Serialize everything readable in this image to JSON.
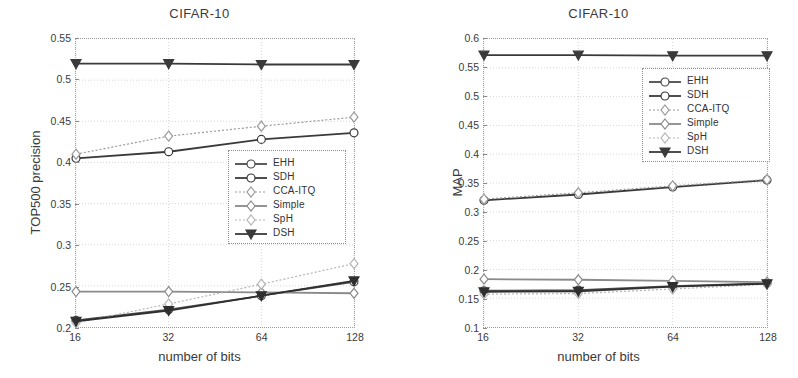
{
  "figure": {
    "x_axis_label": "number of bits",
    "series_names": [
      "EHH",
      "SDH",
      "CCA-ITQ",
      "Simple",
      "SpH",
      "DSH"
    ]
  },
  "chart_data": [
    {
      "type": "line",
      "panel": "left",
      "title": "CIFAR-10",
      "xlabel": "number of bits",
      "ylabel": "TOP500 precision",
      "categories": [
        "16",
        "32",
        "64",
        "128"
      ],
      "x": [
        16,
        32,
        64,
        128
      ],
      "xscale": "log2",
      "xlim": [
        16,
        128
      ],
      "ylim": [
        0.2,
        0.55
      ],
      "yticks": [
        "0.2",
        "0.25",
        "0.3",
        "0.35",
        "0.4",
        "0.45",
        "0.5",
        "0.55"
      ],
      "ytick_values": [
        0.2,
        0.25,
        0.3,
        0.35,
        0.4,
        0.45,
        0.5,
        0.55
      ],
      "grid": true,
      "legend_position": "center-right",
      "series": [
        {
          "name": "EHH",
          "values": [
            0.208,
            0.221,
            0.238,
            0.255
          ],
          "color": "#4a4a4a",
          "marker": "circle",
          "line": "solid"
        },
        {
          "name": "SDH",
          "values": [
            0.405,
            0.413,
            0.428,
            0.436
          ],
          "color": "#3a3a3a",
          "marker": "circle",
          "line": "solid"
        },
        {
          "name": "CCA-ITQ",
          "values": [
            0.41,
            0.432,
            0.444,
            0.455
          ],
          "color": "#9a9a9a",
          "marker": "diamond",
          "line": "dotted"
        },
        {
          "name": "Simple",
          "values": [
            0.243,
            0.243,
            0.242,
            0.241
          ],
          "color": "#8a8a8a",
          "marker": "diamond",
          "line": "solid"
        },
        {
          "name": "SpH",
          "values": [
            0.205,
            0.228,
            0.252,
            0.277
          ],
          "color": "#b4b4b4",
          "marker": "diamond",
          "line": "dotted"
        },
        {
          "name": "DSH",
          "values": [
            0.52,
            0.52,
            0.519,
            0.519
          ],
          "color": "#3a3a3a",
          "marker": "triangle-down",
          "line": "solid"
        },
        {
          "name": "DSH-lower",
          "values": [
            0.207,
            0.22,
            0.238,
            0.256
          ],
          "color": "#2f2f2f",
          "marker": "triangle-down",
          "line": "solid"
        }
      ]
    },
    {
      "type": "line",
      "panel": "right",
      "title": "CIFAR-10",
      "xlabel": "number of bits",
      "ylabel": "MAP",
      "categories": [
        "16",
        "32",
        "64",
        "128"
      ],
      "x": [
        16,
        32,
        64,
        128
      ],
      "xscale": "log2",
      "xlim": [
        16,
        128
      ],
      "ylim": [
        0.1,
        0.6
      ],
      "yticks": [
        "0.1",
        "0.15",
        "0.2",
        "0.25",
        "0.3",
        "0.35",
        "0.4",
        "0.45",
        "0.5",
        "0.55",
        "0.6"
      ],
      "ytick_values": [
        0.1,
        0.15,
        0.2,
        0.25,
        0.3,
        0.35,
        0.4,
        0.45,
        0.5,
        0.55,
        0.6
      ],
      "grid": true,
      "legend_position": "upper-right",
      "series": [
        {
          "name": "EHH",
          "values": [
            0.163,
            0.164,
            0.171,
            0.176
          ],
          "color": "#4a4a4a",
          "marker": "circle",
          "line": "solid"
        },
        {
          "name": "SDH",
          "values": [
            0.32,
            0.33,
            0.343,
            0.355
          ],
          "color": "#3a3a3a",
          "marker": "circle",
          "line": "solid"
        },
        {
          "name": "CCA-ITQ",
          "values": [
            0.322,
            0.333,
            0.345,
            0.356
          ],
          "color": "#9a9a9a",
          "marker": "diamond",
          "line": "dotted"
        },
        {
          "name": "Simple",
          "values": [
            0.183,
            0.182,
            0.18,
            0.178
          ],
          "color": "#8a8a8a",
          "marker": "diamond",
          "line": "solid"
        },
        {
          "name": "SpH",
          "values": [
            0.157,
            0.158,
            0.166,
            0.174
          ],
          "color": "#b4b4b4",
          "marker": "diamond",
          "line": "dotted"
        },
        {
          "name": "DSH",
          "values": [
            0.572,
            0.572,
            0.571,
            0.571
          ],
          "color": "#3a3a3a",
          "marker": "triangle-down",
          "line": "solid"
        },
        {
          "name": "DSH-lower",
          "values": [
            0.161,
            0.162,
            0.17,
            0.175
          ],
          "color": "#2f2f2f",
          "marker": "triangle-down",
          "line": "solid"
        }
      ]
    }
  ]
}
